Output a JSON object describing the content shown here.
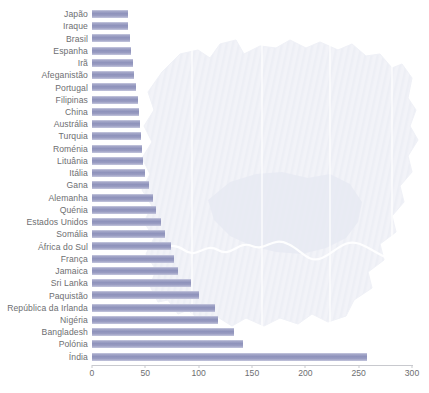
{
  "chart_data": {
    "type": "bar",
    "orientation": "horizontal",
    "title": "",
    "subtitle": "",
    "xlabel": "",
    "ylabel": "",
    "xlim": [
      0,
      300
    ],
    "xticks": [
      0,
      50,
      100,
      150,
      200,
      250,
      300
    ],
    "xtick_labels": [
      "0",
      "50",
      "100",
      "150",
      "200",
      "250",
      "300"
    ],
    "grid": false,
    "legend": "none",
    "background_watermark": "map-of-greater-london-silhouette",
    "bar_color": "#8e92bb",
    "label_color": "#6d6e71",
    "axis_color": "#c8c9ce",
    "categories": [
      "Japão",
      "Iraque",
      "Brasil",
      "Espanha",
      "Irã",
      "Afeganistão",
      "Portugal",
      "Filipinas",
      "China",
      "Austrália",
      "Turquia",
      "Roménia",
      "Lituânia",
      "Itália",
      "Gana",
      "Alemanha",
      "Quénia",
      "Estados Unidos",
      "Somália",
      "África do Sul",
      "França",
      "Jamaica",
      "Sri Lanka",
      "Paquistão",
      "República da Irlanda",
      "Nigéria",
      "Bangladesh",
      "Polónia",
      "Índia"
    ],
    "values": [
      34,
      34,
      36,
      37,
      38,
      39,
      41,
      43,
      44,
      45,
      46,
      47,
      48,
      50,
      53,
      57,
      60,
      65,
      68,
      74,
      77,
      81,
      93,
      100,
      115,
      118,
      133,
      142,
      258
    ]
  }
}
